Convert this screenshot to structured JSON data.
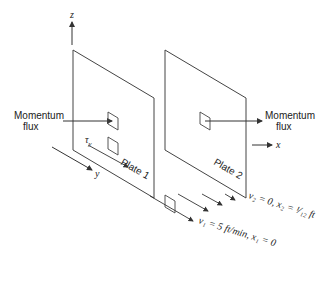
{
  "diagram": {
    "axes": {
      "z_label": "z",
      "y_label": "y",
      "x_label": "x"
    },
    "plates": [
      {
        "label": "Plate 1"
      },
      {
        "label": "Plate 2"
      }
    ],
    "momentum_flux_left": [
      "Momentum",
      "flux"
    ],
    "momentum_flux_right": [
      "Momentum",
      "flux"
    ],
    "shear_label": "τ",
    "shear_sub": "y",
    "plate2_condition": "v₂ = 0, x₂ = ¹⁄₁₂ ft",
    "plate1_condition": "v₁ = 5 ft/min, x₁ = 0",
    "colors": {
      "line": "#333333",
      "background": "#ffffff"
    }
  }
}
